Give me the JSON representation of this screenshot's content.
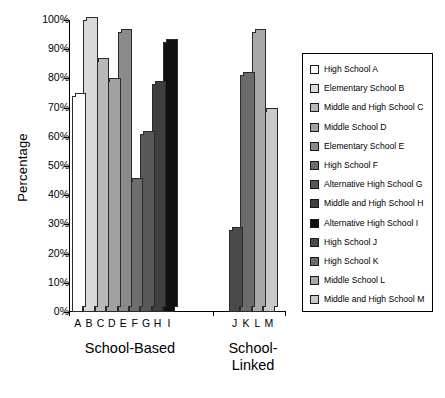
{
  "chart_data": {
    "type": "bar",
    "title": "",
    "xlabel": "",
    "ylabel": "Percentage",
    "ylim": [
      0,
      100
    ],
    "grid": false,
    "legend_position": "right",
    "ytick_labels": [
      "100%",
      "90%",
      "80%",
      "70%",
      "60%",
      "50%",
      "40%",
      "30%",
      "20%",
      "10%",
      "0%"
    ],
    "ytick_values": [
      100,
      90,
      80,
      70,
      60,
      50,
      40,
      30,
      20,
      10,
      0
    ],
    "categories": [
      "A",
      "B",
      "C",
      "D",
      "E",
      "F",
      "G",
      "H",
      "I",
      "J",
      "K",
      "L",
      "M"
    ],
    "values": [
      74,
      100,
      86,
      79,
      96,
      45,
      61,
      78,
      92.5,
      28,
      81,
      96,
      69
    ],
    "groups": [
      {
        "label": "School-Based",
        "categories": [
          "A",
          "B",
          "C",
          "D",
          "E",
          "F",
          "G",
          "H",
          "I"
        ]
      },
      {
        "label": "School-\nLinked",
        "categories": [
          "J",
          "K",
          "L",
          "M"
        ]
      }
    ],
    "bar_colors": [
      "#ffffff",
      "#d9d9d9",
      "#b8b8b8",
      "#a0a0a0",
      "#8a8a8a",
      "#6e6e6e",
      "#585858",
      "#3f3f3f",
      "#101010",
      "#4a4a4a",
      "#6b6b6b",
      "#a8a8a8",
      "#c9c9c9"
    ],
    "legend_entries": [
      {
        "key": "A",
        "label": "High School A",
        "color": "#ffffff"
      },
      {
        "key": "B",
        "label": "Elementary School B",
        "color": "#d9d9d9"
      },
      {
        "key": "C",
        "label": "Middle and High School C",
        "color": "#b8b8b8"
      },
      {
        "key": "D",
        "label": "Middle School D",
        "color": "#a0a0a0"
      },
      {
        "key": "E",
        "label": "Elementary School E",
        "color": "#8a8a8a"
      },
      {
        "key": "F",
        "label": "High School F",
        "color": "#6e6e6e"
      },
      {
        "key": "G",
        "label": "Alternative High School G",
        "color": "#585858"
      },
      {
        "key": "H",
        "label": "Middle and High School H",
        "color": "#3f3f3f"
      },
      {
        "key": "I",
        "label": "Alternative High School I",
        "color": "#101010"
      },
      {
        "key": "J",
        "label": "High School J",
        "color": "#4a4a4a"
      },
      {
        "key": "K",
        "label": "High School K",
        "color": "#6b6b6b"
      },
      {
        "key": "L",
        "label": "Middle School L",
        "color": "#a8a8a8"
      },
      {
        "key": "M",
        "label": "Middle and High School M",
        "color": "#c9c9c9"
      }
    ]
  },
  "group_labels": {
    "school_based": "School-Based",
    "school_linked_line1": "School-",
    "school_linked_line2": "Linked"
  }
}
